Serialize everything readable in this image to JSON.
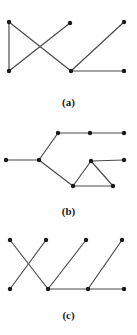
{
  "figure": {
    "background_color": "#ffffff",
    "vertex_color": "#1a1a1a",
    "edge_color": "#4a4a4a",
    "vertex_radius": 2.2,
    "edge_width": 1.2,
    "width": 137,
    "height": 335
  },
  "panels": [
    {
      "id": "a",
      "label": "(a)",
      "label_y": 96,
      "origin_y": 0,
      "vertices": [
        {
          "id": "a1",
          "x": 9,
          "y": 22
        },
        {
          "id": "a2",
          "x": 70,
          "y": 23
        },
        {
          "id": "a3",
          "x": 124,
          "y": 22
        },
        {
          "id": "a4",
          "x": 9,
          "y": 71
        },
        {
          "id": "a5",
          "x": 71,
          "y": 71
        },
        {
          "id": "a6",
          "x": 124,
          "y": 71
        }
      ],
      "edges": [
        {
          "from": "a1",
          "to": "a4"
        },
        {
          "from": "a1",
          "to": "a5"
        },
        {
          "from": "a2",
          "to": "a4"
        },
        {
          "from": "a3",
          "to": "a5"
        },
        {
          "from": "a5",
          "to": "a6"
        }
      ]
    },
    {
      "id": "b",
      "label": "(b)",
      "label_y": 95,
      "origin_y": 110,
      "vertices": [
        {
          "id": "b1",
          "x": 6,
          "y": 50
        },
        {
          "id": "b2",
          "x": 39,
          "y": 50
        },
        {
          "id": "b3",
          "x": 58,
          "y": 23
        },
        {
          "id": "b4",
          "x": 90,
          "y": 23
        },
        {
          "id": "b5",
          "x": 124,
          "y": 23
        },
        {
          "id": "b6",
          "x": 91,
          "y": 51
        },
        {
          "id": "b7",
          "x": 124,
          "y": 50
        },
        {
          "id": "b8",
          "x": 73,
          "y": 76
        },
        {
          "id": "b9",
          "x": 113,
          "y": 76
        }
      ],
      "edges": [
        {
          "from": "b1",
          "to": "b2"
        },
        {
          "from": "b2",
          "to": "b3"
        },
        {
          "from": "b3",
          "to": "b4"
        },
        {
          "from": "b4",
          "to": "b5"
        },
        {
          "from": "b2",
          "to": "b8"
        },
        {
          "from": "b8",
          "to": "b6"
        },
        {
          "from": "b6",
          "to": "b7"
        },
        {
          "from": "b6",
          "to": "b9"
        },
        {
          "from": "b8",
          "to": "b9"
        }
      ]
    },
    {
      "id": "c",
      "label": "(c)",
      "label_y": 84,
      "origin_y": 225,
      "vertices": [
        {
          "id": "c1",
          "x": 10,
          "y": 15
        },
        {
          "id": "c2",
          "x": 46,
          "y": 15
        },
        {
          "id": "c3",
          "x": 86,
          "y": 15
        },
        {
          "id": "c4",
          "x": 122,
          "y": 15
        },
        {
          "id": "c5",
          "x": 10,
          "y": 64
        },
        {
          "id": "c6",
          "x": 48,
          "y": 64
        },
        {
          "id": "c7",
          "x": 88,
          "y": 64
        },
        {
          "id": "c8",
          "x": 124,
          "y": 64
        }
      ],
      "edges": [
        {
          "from": "c1",
          "to": "c6"
        },
        {
          "from": "c2",
          "to": "c5"
        },
        {
          "from": "c3",
          "to": "c6"
        },
        {
          "from": "c4",
          "to": "c7"
        },
        {
          "from": "c6",
          "to": "c7"
        },
        {
          "from": "c7",
          "to": "c8"
        }
      ]
    }
  ]
}
